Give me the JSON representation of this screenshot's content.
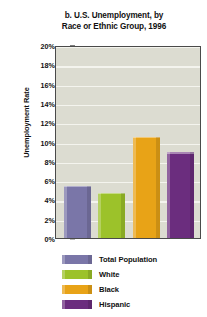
{
  "chart_data": {
    "type": "bar",
    "title": "b. U.S. Unemployment, by Race or Ethnic Group, 1996",
    "title_lines": [
      "b. U.S. Unemployment, by",
      "Race or Ethnic Group, 1996"
    ],
    "xlabel": "",
    "ylabel": "Unemployment Rate",
    "ylim": [
      0,
      20
    ],
    "ytick_step": 2,
    "ytick_labels": [
      "20%",
      "18%",
      "16%",
      "14%",
      "12%",
      "10%",
      "8%",
      "6%",
      "4%",
      "2%",
      "0%"
    ],
    "ytick_values": [
      20,
      18,
      16,
      14,
      12,
      10,
      8,
      6,
      4,
      2,
      0
    ],
    "grid": true,
    "grid_color": "#f4f4ee",
    "plot_background": "#dcdcd1",
    "legend_position": "bottom",
    "categories": [
      "Total Population",
      "White",
      "Black",
      "Hispanic"
    ],
    "values": [
      5.4,
      4.7,
      10.5,
      8.9
    ],
    "value_unit": "percent",
    "colors": [
      "#7a76a8",
      "#9cc22a",
      "#e8a317",
      "#6b2d7e"
    ],
    "series": [
      {
        "name": "Unemployment Rate, 1996",
        "values": [
          5.4,
          4.7,
          10.5,
          8.9
        ]
      }
    ]
  },
  "legend": {
    "items": [
      {
        "label": "Total Population",
        "color": "#7a76a8"
      },
      {
        "label": "White",
        "color": "#9cc22a"
      },
      {
        "label": "Black",
        "color": "#e8a317"
      },
      {
        "label": "Hispanic",
        "color": "#6b2d7e"
      }
    ]
  }
}
